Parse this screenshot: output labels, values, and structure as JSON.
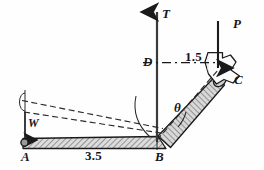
{
  "figure": {
    "kind": "statics-free-body-diagram",
    "background_color": "#fefefe",
    "line_color": "#1a1a1a",
    "hatch_color": "#555555",
    "bar_fill": "#dcdcdc"
  },
  "labels": {
    "force_T": "T",
    "force_P": "P",
    "weight_W": "W",
    "point_A": "A",
    "point_B": "B",
    "point_C": "C",
    "point_D": "D",
    "angle_theta": "θ",
    "dim_horizontal": "3.5",
    "dim_vertical_offset": "1.5"
  },
  "geometry": {
    "points": {
      "A": [
        24,
        143
      ],
      "B": [
        157,
        141
      ],
      "C": [
        222,
        72
      ],
      "D": [
        157,
        62
      ]
    },
    "dimensions": {
      "AB_length": "3.5",
      "DC_length": "1.5"
    },
    "forces": [
      {
        "name": "T",
        "point": "B",
        "direction": "up",
        "label": "T"
      },
      {
        "name": "P",
        "point": "C",
        "direction": "down",
        "label": "P"
      },
      {
        "name": "W",
        "point": "A",
        "direction": "down",
        "label": "W"
      }
    ],
    "angles": [
      {
        "name": "theta",
        "at": "B",
        "between": [
          "dashed-line-BC",
          "bar-BC"
        ],
        "label": "θ"
      }
    ]
  }
}
